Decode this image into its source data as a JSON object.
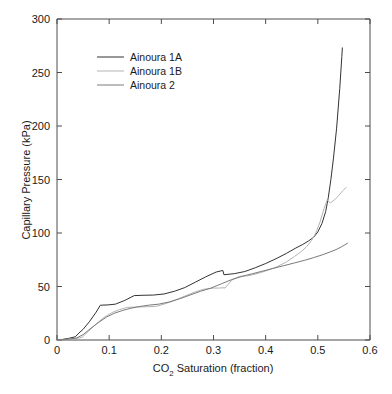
{
  "chart_data": {
    "type": "line",
    "title": "",
    "xlabel": "CO2 Saturation (fraction)",
    "xlabel_main": "CO",
    "xlabel_sub": "2",
    "xlabel_rest": " Saturation (fraction)",
    "ylabel": "Capillary Pressure (kPa)",
    "xlim": [
      0,
      0.6
    ],
    "ylim": [
      0,
      300
    ],
    "xticks": [
      0,
      0.1,
      0.2,
      0.3,
      0.4,
      0.5,
      0.6
    ],
    "xtick_labels": [
      "0",
      "0.1",
      "0.2",
      "0.3",
      "0.4",
      "0.5",
      "0.6"
    ],
    "yticks": [
      0,
      50,
      100,
      150,
      200,
      250,
      300
    ],
    "ytick_labels": [
      "0",
      "50",
      "100",
      "150",
      "200",
      "250",
      "300"
    ],
    "grid": false,
    "legend_position": "upper left",
    "series": [
      {
        "name": "Ainoura 1A",
        "color": "#333333",
        "x": [
          0.0,
          0.01,
          0.022,
          0.035,
          0.042,
          0.05,
          0.062,
          0.075,
          0.083,
          0.098,
          0.112,
          0.13,
          0.148,
          0.165,
          0.185,
          0.205,
          0.225,
          0.245,
          0.265,
          0.285,
          0.305,
          0.318,
          0.32,
          0.34,
          0.36,
          0.38,
          0.4,
          0.42,
          0.44,
          0.458,
          0.47,
          0.482,
          0.492,
          0.5,
          0.508,
          0.515,
          0.52,
          0.525,
          0.53,
          0.536,
          0.542,
          0.546,
          0.547
        ],
        "y": [
          0.0,
          0.5,
          1.5,
          3.0,
          6.5,
          10.0,
          17.0,
          26.0,
          32.5,
          32.8,
          33.5,
          37.0,
          41.5,
          41.8,
          42.0,
          43.0,
          45.5,
          49.0,
          54.0,
          59.0,
          63.5,
          65.0,
          61.0,
          62.0,
          64.0,
          67.5,
          71.5,
          76.0,
          81.0,
          86.0,
          89.0,
          92.5,
          96.0,
          101.0,
          109.0,
          120.0,
          133.0,
          150.0,
          170.0,
          198.0,
          235.0,
          265.0,
          273.0
        ]
      },
      {
        "name": "Ainoura 1B",
        "color": "#b3b3b3",
        "x": [
          0.0,
          0.012,
          0.025,
          0.038,
          0.048,
          0.06,
          0.075,
          0.09,
          0.105,
          0.12,
          0.135,
          0.15,
          0.165,
          0.18,
          0.19,
          0.205,
          0.22,
          0.235,
          0.25,
          0.265,
          0.282,
          0.3,
          0.312,
          0.32,
          0.322,
          0.335,
          0.35,
          0.365,
          0.38,
          0.4,
          0.42,
          0.44,
          0.455,
          0.468,
          0.478,
          0.488,
          0.496,
          0.504,
          0.512,
          0.518,
          0.524,
          0.532,
          0.54,
          0.548,
          0.554
        ],
        "y": [
          0.0,
          0.3,
          0.8,
          1.5,
          2.5,
          8.0,
          15.0,
          21.0,
          25.5,
          28.5,
          30.5,
          30.8,
          31.0,
          31.2,
          31.5,
          33.5,
          36.0,
          39.0,
          42.0,
          45.0,
          47.5,
          48.5,
          48.6,
          48.8,
          48.5,
          56.0,
          59.5,
          60.0,
          61.5,
          64.5,
          68.0,
          73.0,
          78.0,
          82.5,
          87.0,
          93.0,
          100.0,
          110.0,
          123.0,
          131.0,
          128.0,
          131.0,
          135.0,
          139.5,
          142.5
        ]
      },
      {
        "name": "Ainoura 2",
        "color": "#7a7a7a",
        "x": [
          0.0,
          0.012,
          0.025,
          0.038,
          0.05,
          0.065,
          0.08,
          0.095,
          0.11,
          0.125,
          0.14,
          0.155,
          0.175,
          0.195,
          0.215,
          0.235,
          0.255,
          0.275,
          0.295,
          0.315,
          0.335,
          0.355,
          0.375,
          0.395,
          0.415,
          0.435,
          0.455,
          0.475,
          0.492,
          0.508,
          0.522,
          0.535,
          0.545,
          0.552,
          0.557
        ],
        "y": [
          0.0,
          0.4,
          1.0,
          2.0,
          5.0,
          11.0,
          16.5,
          21.5,
          25.0,
          27.5,
          29.5,
          31.0,
          32.5,
          33.5,
          35.5,
          38.5,
          42.0,
          45.5,
          48.5,
          52.5,
          56.5,
          59.5,
          62.0,
          64.5,
          67.0,
          69.5,
          72.0,
          74.5,
          77.0,
          79.5,
          82.0,
          84.5,
          87.0,
          89.0,
          90.5
        ]
      }
    ]
  },
  "legend": {
    "entries": [
      {
        "label": "Ainoura 1A",
        "color": "#333333"
      },
      {
        "label": "Ainoura 1B",
        "color": "#b3b3b3"
      },
      {
        "label": "Ainoura 2",
        "color": "#7a7a7a"
      }
    ]
  },
  "axes": {
    "x_title_prefix": "CO",
    "x_title_subscript": "2",
    "x_title_suffix": " Saturation (fraction)",
    "y_title": "Capillary Pressure (kPa)"
  }
}
